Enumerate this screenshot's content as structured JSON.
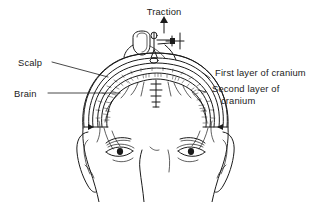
{
  "figure": {
    "kind": "medical-line-illustration",
    "background_color": "#ffffff",
    "ink_color": "#1b1b1b",
    "width": 328,
    "height": 202
  },
  "labels": {
    "traction": "Traction",
    "scalp": "Scalp",
    "brain": "Brain",
    "first_layer": "First layer of cranium",
    "second_layer_line1": "Second layer of",
    "second_layer_line2": "cranium"
  },
  "annotations": [
    {
      "name": "traction",
      "text": "Traction",
      "position": "top-center",
      "has_arrow": true,
      "arrow_direction": "up",
      "points_to": "traction-device"
    },
    {
      "name": "scalp",
      "text": "Scalp",
      "position": "left-upper",
      "has_arrow": false,
      "points_to": "scalp-layer"
    },
    {
      "name": "brain",
      "text": "Brain",
      "position": "left-lower",
      "has_arrow": false,
      "points_to": "brain-region"
    },
    {
      "name": "first-layer-of-cranium",
      "text": "First layer of cranium",
      "position": "right-upper",
      "has_arrow": false,
      "points_to": "outer-cranium-layer"
    },
    {
      "name": "second-layer-of-cranium",
      "text": "Second layer of cranium",
      "position": "right-lower",
      "has_arrow": false,
      "points_to": "inner-cranium-layer"
    }
  ],
  "anatomy_parts": [
    "scalp",
    "first layer of cranium",
    "second layer of cranium",
    "brain",
    "left ear",
    "right ear",
    "left eye",
    "right eye",
    "left eyebrow",
    "right eyebrow",
    "nose bridge"
  ],
  "device": {
    "name": "traction-device",
    "description": "Clamp bracket mounted on top of the skull with a screw fitting and an upward traction arrow"
  }
}
